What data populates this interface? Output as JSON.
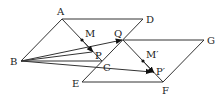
{
  "diagram": {
    "labels": {
      "A": "A",
      "B": "B",
      "C": "C",
      "D": "D",
      "E": "E",
      "F": "F",
      "G": "G",
      "Q": "Q",
      "M": "M",
      "P": "P",
      "M_prime": "M′",
      "P_prime": "P′"
    },
    "colors": {
      "stroke": "#333333",
      "text": "#222222",
      "background": "#ffffff"
    }
  }
}
